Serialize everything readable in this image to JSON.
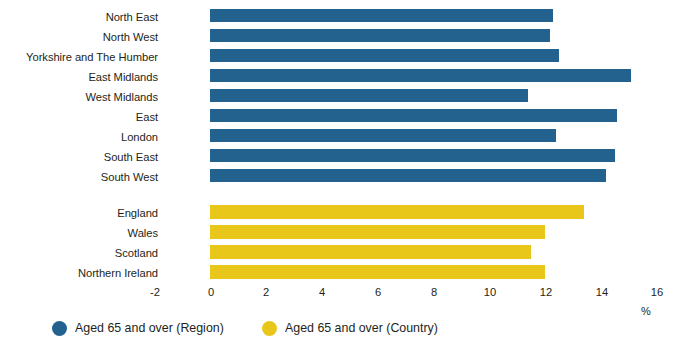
{
  "chart_data": {
    "type": "bar",
    "orientation": "horizontal",
    "title": "",
    "xlabel": "%",
    "ylabel": "",
    "xlim": [
      -2,
      16
    ],
    "xticks": [
      "-2",
      "0",
      "2",
      "4",
      "6",
      "8",
      "10",
      "12",
      "14",
      "16"
    ],
    "grid": false,
    "legend_position": "bottom-left",
    "series": [
      {
        "name": "Aged 65 and over (Region)",
        "color": "#23628f",
        "categories": [
          "North East",
          "North West",
          "Yorkshire and The Humber",
          "East Midlands",
          "West Midlands",
          "East",
          "London",
          "South East",
          "South West"
        ],
        "values": [
          12.3,
          12.2,
          12.5,
          15.1,
          11.4,
          14.6,
          12.4,
          14.5,
          14.2
        ]
      },
      {
        "name": "Aged 65 and over (Country)",
        "color": "#e9c71a",
        "categories": [
          "England",
          "Wales",
          "Scotland",
          "Northern Ireland"
        ],
        "values": [
          13.4,
          12.0,
          11.5,
          12.0
        ]
      }
    ]
  },
  "categories": {
    "region": [
      "North East",
      "North West",
      "Yorkshire and The Humber",
      "East Midlands",
      "West Midlands",
      "East",
      "London",
      "South East",
      "South West"
    ],
    "country": [
      "England",
      "Wales",
      "Scotland",
      "Northern Ireland"
    ]
  },
  "axis": {
    "ticks": [
      "-2",
      "0",
      "2",
      "4",
      "6",
      "8",
      "10",
      "12",
      "14",
      "16"
    ],
    "unit": "%"
  },
  "legend": {
    "region_label": "Aged 65 and over (Region)",
    "country_label": "Aged 65 and over (Country)"
  },
  "colors": {
    "region": "#23628f",
    "country": "#e9c71a",
    "text": "#231f20",
    "background": "#ffffff"
  }
}
